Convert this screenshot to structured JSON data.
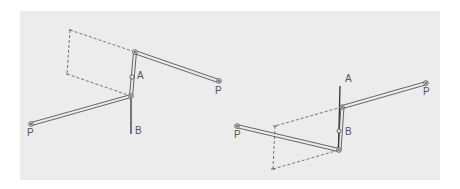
{
  "diagram": {
    "background_color": "#ececec",
    "line_color": "#444444",
    "left_figure": {
      "labels": {
        "A": "A",
        "B": "B",
        "P_left": "P",
        "P_right": "P"
      }
    },
    "right_figure": {
      "labels": {
        "A": "A",
        "B": "B",
        "P_left": "P",
        "P_right": "P"
      }
    }
  }
}
